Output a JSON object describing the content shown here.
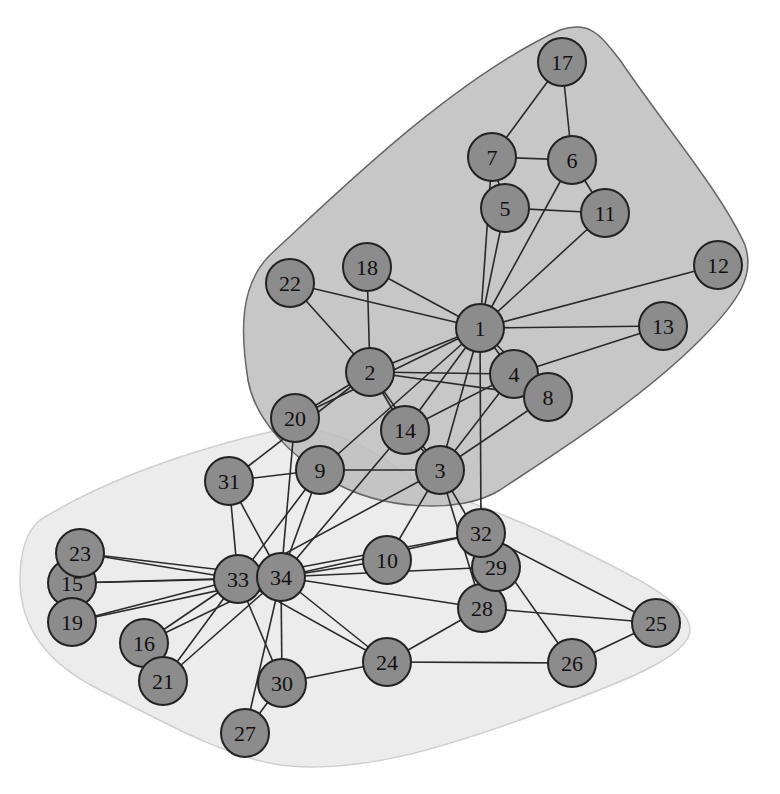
{
  "diagram": {
    "type": "network-graph",
    "node_radius": 24,
    "colors": {
      "node_fill": "#8c8c8c",
      "node_stroke": "#222222",
      "edge": "#2a2a2a",
      "hull_a_fill": "#c4c4c4",
      "hull_a_stroke": "#666666",
      "hull_b_fill": "#ececec",
      "hull_b_stroke": "#cfcfcf",
      "label": "#111111"
    },
    "nodes": [
      {
        "id": "1",
        "x": 480,
        "y": 328
      },
      {
        "id": "2",
        "x": 370,
        "y": 372
      },
      {
        "id": "3",
        "x": 440,
        "y": 470
      },
      {
        "id": "4",
        "x": 514,
        "y": 374
      },
      {
        "id": "5",
        "x": 505,
        "y": 208
      },
      {
        "id": "6",
        "x": 572,
        "y": 160
      },
      {
        "id": "7",
        "x": 492,
        "y": 157
      },
      {
        "id": "8",
        "x": 548,
        "y": 397
      },
      {
        "id": "9",
        "x": 320,
        "y": 470
      },
      {
        "id": "10",
        "x": 387,
        "y": 560
      },
      {
        "id": "11",
        "x": 605,
        "y": 213
      },
      {
        "id": "12",
        "x": 718,
        "y": 265
      },
      {
        "id": "13",
        "x": 663,
        "y": 326
      },
      {
        "id": "14",
        "x": 405,
        "y": 430
      },
      {
        "id": "15",
        "x": 72,
        "y": 583
      },
      {
        "id": "16",
        "x": 144,
        "y": 643
      },
      {
        "id": "17",
        "x": 562,
        "y": 62
      },
      {
        "id": "18",
        "x": 367,
        "y": 267
      },
      {
        "id": "19",
        "x": 72,
        "y": 622
      },
      {
        "id": "20",
        "x": 295,
        "y": 418
      },
      {
        "id": "21",
        "x": 163,
        "y": 681
      },
      {
        "id": "22",
        "x": 290,
        "y": 283
      },
      {
        "id": "23",
        "x": 80,
        "y": 553
      },
      {
        "id": "24",
        "x": 387,
        "y": 662
      },
      {
        "id": "25",
        "x": 656,
        "y": 623
      },
      {
        "id": "26",
        "x": 572,
        "y": 663
      },
      {
        "id": "27",
        "x": 245,
        "y": 733
      },
      {
        "id": "28",
        "x": 482,
        "y": 608
      },
      {
        "id": "29",
        "x": 496,
        "y": 567
      },
      {
        "id": "30",
        "x": 282,
        "y": 683
      },
      {
        "id": "31",
        "x": 229,
        "y": 481
      },
      {
        "id": "32",
        "x": 481,
        "y": 533
      },
      {
        "id": "33",
        "x": 238,
        "y": 579
      },
      {
        "id": "34",
        "x": 281,
        "y": 577
      }
    ],
    "edges": [
      [
        "1",
        "2"
      ],
      [
        "1",
        "3"
      ],
      [
        "1",
        "4"
      ],
      [
        "1",
        "5"
      ],
      [
        "1",
        "6"
      ],
      [
        "1",
        "7"
      ],
      [
        "1",
        "8"
      ],
      [
        "1",
        "9"
      ],
      [
        "1",
        "11"
      ],
      [
        "1",
        "12"
      ],
      [
        "1",
        "13"
      ],
      [
        "1",
        "14"
      ],
      [
        "1",
        "18"
      ],
      [
        "1",
        "20"
      ],
      [
        "1",
        "22"
      ],
      [
        "1",
        "32"
      ],
      [
        "2",
        "3"
      ],
      [
        "2",
        "4"
      ],
      [
        "2",
        "8"
      ],
      [
        "2",
        "14"
      ],
      [
        "2",
        "18"
      ],
      [
        "2",
        "20"
      ],
      [
        "2",
        "22"
      ],
      [
        "2",
        "31"
      ],
      [
        "3",
        "4"
      ],
      [
        "3",
        "8"
      ],
      [
        "3",
        "9"
      ],
      [
        "3",
        "10"
      ],
      [
        "3",
        "14"
      ],
      [
        "3",
        "28"
      ],
      [
        "3",
        "29"
      ],
      [
        "3",
        "33"
      ],
      [
        "4",
        "8"
      ],
      [
        "4",
        "13"
      ],
      [
        "4",
        "14"
      ],
      [
        "5",
        "7"
      ],
      [
        "5",
        "11"
      ],
      [
        "6",
        "7"
      ],
      [
        "6",
        "11"
      ],
      [
        "6",
        "17"
      ],
      [
        "7",
        "17"
      ],
      [
        "9",
        "31"
      ],
      [
        "9",
        "33"
      ],
      [
        "9",
        "34"
      ],
      [
        "10",
        "34"
      ],
      [
        "14",
        "34"
      ],
      [
        "15",
        "33"
      ],
      [
        "15",
        "34"
      ],
      [
        "16",
        "33"
      ],
      [
        "16",
        "34"
      ],
      [
        "19",
        "33"
      ],
      [
        "19",
        "34"
      ],
      [
        "20",
        "34"
      ],
      [
        "21",
        "33"
      ],
      [
        "21",
        "34"
      ],
      [
        "23",
        "33"
      ],
      [
        "23",
        "34"
      ],
      [
        "24",
        "26"
      ],
      [
        "24",
        "28"
      ],
      [
        "24",
        "30"
      ],
      [
        "24",
        "33"
      ],
      [
        "24",
        "34"
      ],
      [
        "25",
        "26"
      ],
      [
        "25",
        "28"
      ],
      [
        "25",
        "32"
      ],
      [
        "26",
        "32"
      ],
      [
        "27",
        "30"
      ],
      [
        "27",
        "34"
      ],
      [
        "28",
        "34"
      ],
      [
        "29",
        "32"
      ],
      [
        "29",
        "34"
      ],
      [
        "30",
        "33"
      ],
      [
        "30",
        "34"
      ],
      [
        "31",
        "33"
      ],
      [
        "31",
        "34"
      ],
      [
        "32",
        "33"
      ],
      [
        "32",
        "34"
      ],
      [
        "33",
        "34"
      ]
    ],
    "hulls": [
      {
        "name": "community-a",
        "members": [
          "1",
          "2",
          "3",
          "4",
          "5",
          "6",
          "7",
          "8",
          "11",
          "12",
          "13",
          "14",
          "17",
          "18",
          "20",
          "22"
        ]
      },
      {
        "name": "community-b",
        "members": [
          "9",
          "10",
          "15",
          "16",
          "19",
          "21",
          "23",
          "24",
          "25",
          "26",
          "27",
          "28",
          "29",
          "30",
          "31",
          "32",
          "33",
          "34"
        ]
      }
    ]
  }
}
